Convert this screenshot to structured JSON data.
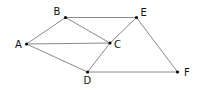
{
  "diagram": {
    "type": "undirected-graph",
    "line_color": "#8a8a8a",
    "node_color": "#000000",
    "nodes": [
      {
        "id": "A",
        "label": "A",
        "x": 26.5,
        "y": 44,
        "label_x": 15,
        "label_y": 47.5
      },
      {
        "id": "B",
        "label": "B",
        "x": 65.5,
        "y": 17.5,
        "label_x": 53.5,
        "label_y": 14.5
      },
      {
        "id": "C",
        "label": "C",
        "x": 110,
        "y": 43,
        "label_x": 114,
        "label_y": 47.5
      },
      {
        "id": "D",
        "label": "D",
        "x": 87.5,
        "y": 72,
        "label_x": 83.5,
        "label_y": 84
      },
      {
        "id": "E",
        "label": "E",
        "x": 136.5,
        "y": 17.5,
        "label_x": 140.5,
        "label_y": 15.5
      },
      {
        "id": "F",
        "label": "F",
        "x": 177.5,
        "y": 72,
        "label_x": 184,
        "label_y": 75.5
      }
    ],
    "edges": [
      [
        "A",
        "B"
      ],
      [
        "A",
        "C"
      ],
      [
        "A",
        "D"
      ],
      [
        "B",
        "C"
      ],
      [
        "B",
        "E"
      ],
      [
        "E",
        "C"
      ],
      [
        "C",
        "D"
      ],
      [
        "E",
        "F"
      ],
      [
        "D",
        "F"
      ]
    ]
  }
}
